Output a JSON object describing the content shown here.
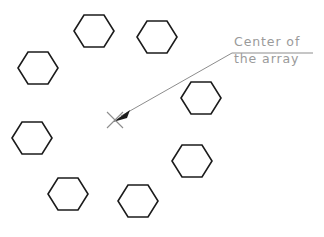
{
  "drawing": {
    "title": "polar-array-of-hexagons",
    "background_color": "#ffffff",
    "width": 324,
    "height": 237,
    "shape_stroke_color": "#1b1b1b",
    "leader_color": "#8d8d8d",
    "text_color": "#9a9a9a"
  },
  "annotation": {
    "line1": "Center of",
    "line2": "the array",
    "text_x": 234,
    "line1_y": 46,
    "line2_y": 63,
    "leader_path": "M 313 53 L 232 53 L 121 116",
    "arrow_points": "113 122, 130 110, 127 118",
    "arrow_tip_x": 113,
    "arrow_tip_y": 122
  },
  "center_marker": {
    "label": "x-center-mark",
    "x": 115,
    "y": 120,
    "arm": 8
  },
  "hexagons": [
    {
      "id": "hex-top-left",
      "cx": 94,
      "cy": 31,
      "rx": 20,
      "ry": 16
    },
    {
      "id": "hex-top-right",
      "cx": 157,
      "cy": 37,
      "rx": 20,
      "ry": 16
    },
    {
      "id": "hex-left-upper",
      "cx": 38,
      "cy": 68,
      "rx": 20,
      "ry": 16
    },
    {
      "id": "hex-right-upper",
      "cx": 201,
      "cy": 98,
      "rx": 20,
      "ry": 16
    },
    {
      "id": "hex-left-lower",
      "cx": 32,
      "cy": 138,
      "rx": 20,
      "ry": 16
    },
    {
      "id": "hex-right-lower",
      "cx": 192,
      "cy": 161,
      "rx": 20,
      "ry": 16
    },
    {
      "id": "hex-bottom-left",
      "cx": 68,
      "cy": 194,
      "rx": 20,
      "ry": 16
    },
    {
      "id": "hex-bottom-right",
      "cx": 138,
      "cy": 201,
      "rx": 20,
      "ry": 16
    }
  ]
}
